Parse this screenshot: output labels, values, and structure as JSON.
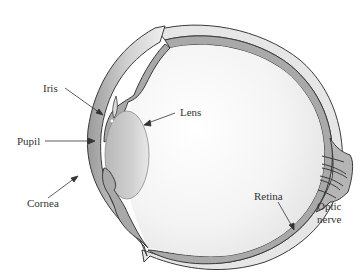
{
  "diagram": {
    "labels": {
      "iris": "Iris",
      "pupil": "Pupil",
      "cornea": "Cornea",
      "lens": "Lens",
      "retina": "Retina",
      "optic_nerve_line1": "Optic",
      "optic_nerve_line2": "nerve"
    },
    "colors": {
      "outline": "#3a3a3a",
      "tissue_gray": "#a8a8a8",
      "sclera_light": "#e4e4e4",
      "interior_light": "#f2f2f2",
      "lens_fill": "#c8c8c8",
      "label_text": "#333333"
    }
  }
}
